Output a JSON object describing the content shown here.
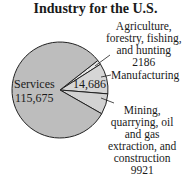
{
  "chart_data": {
    "type": "pie",
    "title": "Industry for the U.S.",
    "categories": [
      "Services",
      "Manufacturing",
      "Agriculture, forestry, fishing, and hunting",
      "Mining, quarrying, oil and gas extraction, and construction"
    ],
    "values": [
      115675,
      14686,
      2186,
      9921
    ],
    "value_labels": [
      "115,675",
      "14,686",
      "2186",
      "9921"
    ],
    "colors": [
      "#bdbdbd",
      "#d6d6d6",
      "#e6e6e6",
      "#d2d2d2"
    ]
  },
  "labels": {
    "title": "Industry for the U.S.",
    "services_name": "Services",
    "services_value": "115,675",
    "manufacturing_value": "14,686",
    "manufacturing_name": "Manufacturing",
    "agri_line1": "Agriculture,",
    "agri_line2": "forestry, fishing,",
    "agri_line3": "and hunting",
    "agri_value": "2186",
    "mining_line1": "Mining,",
    "mining_line2": "quarrying, oil",
    "mining_line3": "and gas",
    "mining_line4": "extraction, and",
    "mining_line5": "construction",
    "mining_value": "9921"
  }
}
